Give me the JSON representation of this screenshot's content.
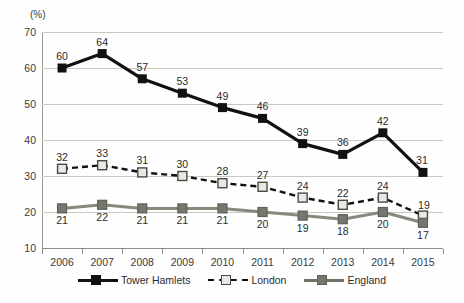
{
  "axis": {
    "unit_label": "(%)",
    "y_ticks": [
      70,
      60,
      50,
      40,
      30,
      20,
      10
    ],
    "y_min": 10,
    "y_max": 70
  },
  "colors": {
    "tower_hamlets": "#111111",
    "london_fill": "#e9e9e4",
    "london_stroke": "#4a4a45",
    "england": "#74786d",
    "gridline": "#c9c9c2",
    "axis": "#8d8d85"
  },
  "legend": {
    "items": [
      {
        "label": "Tower Hamlets",
        "style": "solid-black",
        "marker": "black"
      },
      {
        "label": "London",
        "style": "dashed-black",
        "marker": "london"
      },
      {
        "label": "England",
        "style": "solid-gray",
        "marker": "england"
      }
    ]
  },
  "chart_data": {
    "type": "line",
    "title": "",
    "xlabel": "",
    "ylabel": "(%)",
    "ylim": [
      10,
      70
    ],
    "ytick_step": 10,
    "grid": true,
    "legend_position": "bottom",
    "categories": [
      "2006",
      "2007",
      "2008",
      "2009",
      "2010",
      "2011",
      "2012",
      "2013",
      "2014",
      "2015"
    ],
    "series": [
      {
        "name": "Tower Hamlets",
        "values": [
          60,
          64,
          57,
          53,
          49,
          46,
          39,
          36,
          42,
          31
        ],
        "line": "solid",
        "color": "#111111",
        "marker": "filled-square",
        "label_position": "above"
      },
      {
        "name": "London",
        "values": [
          32,
          33,
          31,
          30,
          28,
          27,
          24,
          22,
          24,
          19
        ],
        "line": "dashed",
        "color": "#111111",
        "marker": "open-square",
        "label_position": "above"
      },
      {
        "name": "England",
        "values": [
          21,
          22,
          21,
          21,
          21,
          20,
          19,
          18,
          20,
          17
        ],
        "line": "solid",
        "color": "#74786d",
        "marker": "gray-square",
        "label_position": "below"
      }
    ]
  }
}
